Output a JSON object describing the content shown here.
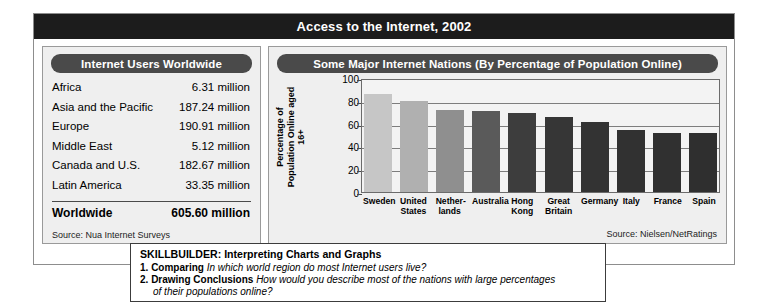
{
  "figure": {
    "title": "Access to the Internet, 2002"
  },
  "table_panel": {
    "header": "Internet Users Worldwide",
    "rows": [
      {
        "region": "Africa",
        "users": "6.31 million"
      },
      {
        "region": "Asia and the Pacific",
        "users": "187.24 million"
      },
      {
        "region": "Europe",
        "users": "190.91 million"
      },
      {
        "region": "Middle East",
        "users": "5.12 million"
      },
      {
        "region": "Canada and U.S.",
        "users": "182.67 million"
      },
      {
        "region": "Latin America",
        "users": "33.35 million"
      }
    ],
    "total": {
      "region": "Worldwide",
      "users": "605.60 million"
    },
    "source": "Source: Nua Internet Surveys"
  },
  "chart_panel": {
    "header": "Some Major Internet Nations (By Percentage of Population Online)",
    "source": "Source: Nielsen/NetRatings"
  },
  "chart_data": {
    "type": "bar",
    "title": "Some Major Internet Nations (By Percentage of Population Online)",
    "xlabel": "",
    "ylabel": "Percentage of Population Online aged 16+",
    "ylim": [
      0,
      100
    ],
    "yticks": [
      100,
      80,
      60,
      40,
      20,
      0
    ],
    "grid": true,
    "legend": "none",
    "categories": [
      "Sweden",
      "United States",
      "Nether-lands",
      "Australia",
      "Hong Kong",
      "Great Britain",
      "Germany",
      "Italy",
      "France",
      "Spain"
    ],
    "category_lines": [
      [
        "Sweden"
      ],
      [
        "United",
        "States"
      ],
      [
        "Nether-",
        "lands"
      ],
      [
        "Australia"
      ],
      [
        "Hong",
        "Kong"
      ],
      [
        "Great",
        "Britain"
      ],
      [
        "Germany"
      ],
      [
        "Italy"
      ],
      [
        "France"
      ],
      [
        "Spain"
      ]
    ],
    "values": [
      86,
      80,
      72,
      71,
      69,
      66,
      61,
      54,
      52,
      52
    ],
    "bar_colors": [
      "#c6c6c6",
      "#b0b0b0",
      "#8f8f8f",
      "#5a5a5a",
      "#3d3d3d",
      "#363636",
      "#333333",
      "#313131",
      "#303030",
      "#2f2f2f"
    ]
  },
  "skillbuilder": {
    "title": "SKILLBUILDER: Interpreting Charts and Graphs",
    "questions": [
      {
        "num": "1.",
        "label": "Comparing",
        "text": "In which world region do most Internet users live?"
      },
      {
        "num": "2.",
        "label": "Drawing Conclusions",
        "text": "How would you describe most of the nations with large percentages",
        "text2": "of their populations online?"
      }
    ]
  }
}
